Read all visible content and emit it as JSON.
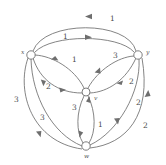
{
  "figure": {
    "name": "directed-weighted-graph",
    "type": "graph-diagram",
    "background_color": "#ffffff",
    "stroke_color": "#6e6e6e",
    "label_color": "#4a4a4a"
  },
  "nodes": [
    {
      "id": "x",
      "label": "x",
      "cx": 31,
      "cy": 55,
      "r": 4.2,
      "label_x": 21,
      "label_y": 54
    },
    {
      "id": "y",
      "label": "y",
      "cx": 138,
      "cy": 55,
      "r": 4.2,
      "label_x": 146,
      "label_y": 54
    },
    {
      "id": "v",
      "label": "v",
      "cx": 86,
      "cy": 92,
      "r": 4.0,
      "label_x": 94,
      "label_y": 100
    },
    {
      "id": "w",
      "label": "w",
      "cx": 86,
      "cy": 146,
      "r": 4.2,
      "label_x": 84,
      "label_y": 158
    }
  ],
  "edges": [
    {
      "id": "e1",
      "from": "y",
      "to": "x",
      "weight": "1",
      "label_x": 110,
      "label_y": 21,
      "note": "outer top arc, arrow points left toward x"
    },
    {
      "id": "e2",
      "from": "x",
      "to": "y",
      "weight": "1",
      "label_x": 63,
      "label_y": 39,
      "note": "inner top arc, arrow points right toward y"
    },
    {
      "id": "e3",
      "from": "v",
      "to": "x",
      "weight": "1",
      "label_x": 72,
      "label_y": 62,
      "note": "arrow points left toward x"
    },
    {
      "id": "e4",
      "from": "v",
      "to": "y",
      "weight": "3",
      "label_x": 113,
      "label_y": 58,
      "note": "arrow points up-left toward v"
    },
    {
      "id": "e5",
      "from": "x",
      "to": "v",
      "weight": "2",
      "label_x": 46,
      "label_y": 89,
      "note": "arrow points right toward v"
    },
    {
      "id": "e6",
      "from": "v",
      "to": "y",
      "weight": "2",
      "label_x": 129,
      "label_y": 84,
      "note": "arrow points right toward y"
    },
    {
      "id": "e7",
      "from": "y",
      "to": "w",
      "weight": "2",
      "label_x": 136,
      "label_y": 105,
      "note": "arrow points down toward w"
    },
    {
      "id": "e8",
      "from": "w",
      "to": "y",
      "weight": "2",
      "label_x": 143,
      "label_y": 128,
      "note": "outer right arc, arrow points up toward y"
    },
    {
      "id": "e9",
      "from": "x",
      "to": "w",
      "weight": "3",
      "label_x": 14,
      "label_y": 102,
      "note": "outer left arc, arrow points down toward w"
    },
    {
      "id": "e10",
      "from": "x",
      "to": "w",
      "weight": "3",
      "label_x": 40,
      "label_y": 120,
      "note": "inner left arc, arrow points down-right toward w"
    },
    {
      "id": "e11",
      "from": "v",
      "to": "w",
      "weight": "3",
      "label_x": 72,
      "label_y": 110,
      "note": "left bow, arrow points down toward w"
    },
    {
      "id": "e12",
      "from": "w",
      "to": "v",
      "weight": "1",
      "label_x": 98,
      "label_y": 127,
      "note": "right bow, arrow points up toward v"
    }
  ],
  "weights_summary": {
    "all_values": [
      "1",
      "1",
      "1",
      "3",
      "2",
      "2",
      "2",
      "2",
      "3",
      "3",
      "3",
      "1"
    ]
  }
}
